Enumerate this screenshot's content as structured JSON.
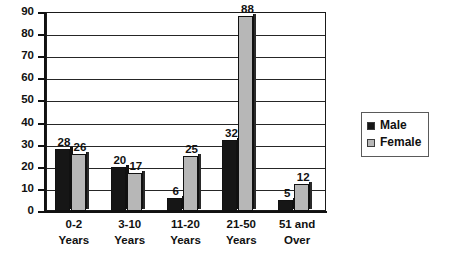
{
  "chart_data": {
    "type": "bar",
    "title": "",
    "xlabel": "",
    "ylabel": "",
    "categories": [
      "0-2 Years",
      "3-10 Years",
      "11-20 Years",
      "21-50 Years",
      "51 and Over"
    ],
    "category_lines": [
      [
        "0-2",
        "Years"
      ],
      [
        "3-10",
        "Years"
      ],
      [
        "11-20",
        "Years"
      ],
      [
        "21-50",
        "Years"
      ],
      [
        "51 and",
        "Over"
      ]
    ],
    "series": [
      {
        "name": "Male",
        "color": "#161616",
        "values": [
          28,
          20,
          6,
          32,
          5
        ]
      },
      {
        "name": "Female",
        "color": "#b7b7b7",
        "values": [
          26,
          17,
          25,
          88,
          12
        ]
      }
    ],
    "ylim": [
      0,
      90
    ],
    "ytick_step": 10,
    "ytick_labels": [
      "0",
      "10",
      "20",
      "30",
      "40",
      "50",
      "60",
      "70",
      "80",
      "90"
    ],
    "grid": true,
    "grid_axis": "y",
    "legend_position": "right",
    "show_value_labels": true
  },
  "legend": {
    "entries": [
      {
        "label": "Male",
        "color": "#161616"
      },
      {
        "label": "Female",
        "color": "#b7b7b7"
      }
    ]
  }
}
